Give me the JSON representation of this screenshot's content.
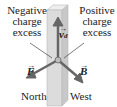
{
  "labels": {
    "negative": [
      "Negative",
      "charge",
      "excess"
    ],
    "positive": [
      "Positive",
      "charge",
      "excess"
    ],
    "north": "North",
    "west": "West"
  },
  "vectors": {
    "drift_velocity": {
      "symbol": "v",
      "subscript": "d"
    },
    "force": {
      "symbol": "F"
    },
    "field": {
      "symbol": "B"
    }
  },
  "colors": {
    "arrow": "#666666",
    "bar": "#d8d8d8",
    "text": "#222222"
  }
}
